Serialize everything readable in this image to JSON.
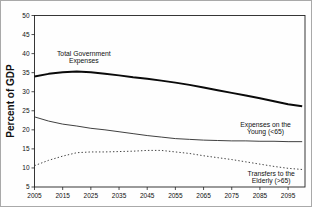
{
  "chart_data": {
    "type": "line",
    "title": "",
    "xlabel": "",
    "ylabel": "Percent of GDP",
    "xlim": [
      2005,
      2101
    ],
    "ylim": [
      5,
      50
    ],
    "xticks": [
      2005,
      2015,
      2025,
      2035,
      2045,
      2055,
      2065,
      2075,
      2085,
      2095
    ],
    "yticks": [
      5,
      10,
      15,
      20,
      25,
      30,
      35,
      40,
      45,
      50
    ],
    "grid": false,
    "legend_position": "none",
    "x": [
      2005,
      2010,
      2015,
      2020,
      2025,
      2030,
      2035,
      2040,
      2045,
      2050,
      2055,
      2060,
      2065,
      2070,
      2075,
      2080,
      2085,
      2090,
      2095,
      2100
    ],
    "series": [
      {
        "name": "Total Government Expenses",
        "style": "solid-thick",
        "values": [
          34.0,
          34.7,
          35.1,
          35.3,
          35.1,
          34.7,
          34.3,
          33.8,
          33.4,
          32.9,
          32.4,
          31.8,
          31.1,
          30.4,
          29.7,
          29.0,
          28.3,
          27.5,
          26.7,
          26.2
        ]
      },
      {
        "name": "Expenses on the Young (<65)",
        "style": "solid-thin",
        "values": [
          23.4,
          22.3,
          21.5,
          21.0,
          20.4,
          20.0,
          19.5,
          19.0,
          18.5,
          18.1,
          17.7,
          17.5,
          17.3,
          17.2,
          17.1,
          17.1,
          17.0,
          17.0,
          16.9,
          16.9
        ]
      },
      {
        "name": "Transfers to the Elderly (>65)",
        "style": "dotted",
        "values": [
          10.6,
          12.0,
          13.1,
          14.0,
          14.2,
          14.2,
          14.3,
          14.4,
          14.6,
          14.6,
          14.2,
          13.8,
          13.2,
          12.7,
          12.2,
          11.6,
          11.0,
          10.4,
          9.9,
          9.6
        ]
      }
    ],
    "annotations": [
      {
        "lines": [
          "Total Government",
          "Expenses"
        ],
        "x": 2022.5,
        "y": 39.5
      },
      {
        "lines": [
          "Expenses on the",
          "Young (<65)"
        ],
        "x": 2087,
        "y": 20.8
      },
      {
        "lines": [
          "Transfers to the",
          "Elderly (>65)"
        ],
        "x": 2089,
        "y": 7.9
      }
    ],
    "colors": {
      "axis": "#222222",
      "text": "#111111",
      "thick_line": "#0a0a0a",
      "thin_line": "#2a2a2a",
      "dotted_line": "#3a3a3a"
    }
  }
}
